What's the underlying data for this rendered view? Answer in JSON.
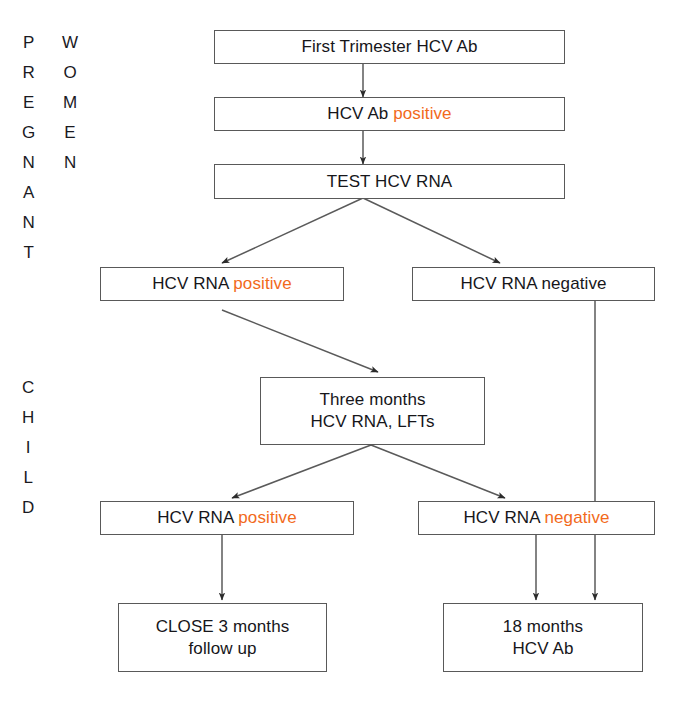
{
  "diagram": {
    "accent_color": "#f26a1b",
    "line_color": "#595959",
    "text_color": "#16161a",
    "side_labels": [
      {
        "name": "pregnant",
        "text": "PREGNANT"
      },
      {
        "name": "women",
        "text": "WOMEN"
      },
      {
        "name": "child",
        "text": "CHILD"
      }
    ],
    "nodes": [
      {
        "id": "first-trimester",
        "lines": [
          {
            "plain": "First Trimester HCV Ab",
            "highlight": ""
          }
        ]
      },
      {
        "id": "hcv-ab-positive",
        "lines": [
          {
            "plain": "HCV Ab ",
            "highlight": "positive"
          }
        ]
      },
      {
        "id": "test-hcv-rna",
        "lines": [
          {
            "plain": "TEST HCV RNA",
            "highlight": ""
          }
        ]
      },
      {
        "id": "rna-positive-mother",
        "lines": [
          {
            "plain": "HCV RNA ",
            "highlight": "positive"
          }
        ]
      },
      {
        "id": "rna-negative-mother",
        "lines": [
          {
            "plain": "HCV RNA negative",
            "highlight": ""
          }
        ]
      },
      {
        "id": "three-months",
        "lines": [
          {
            "plain": "Three months",
            "highlight": ""
          },
          {
            "plain": "HCV RNA, LFTs",
            "highlight": ""
          }
        ]
      },
      {
        "id": "rna-positive-child",
        "lines": [
          {
            "plain": "HCV RNA ",
            "highlight": "positive"
          }
        ]
      },
      {
        "id": "rna-negative-child",
        "lines": [
          {
            "plain": "HCV RNA ",
            "highlight": "negative"
          }
        ]
      },
      {
        "id": "close-followup",
        "lines": [
          {
            "plain": "CLOSE 3 months",
            "highlight": ""
          },
          {
            "plain": "follow up",
            "highlight": ""
          }
        ]
      },
      {
        "id": "eighteen-months",
        "lines": [
          {
            "plain": "18 months",
            "highlight": ""
          },
          {
            "plain": "HCV Ab",
            "highlight": ""
          }
        ]
      }
    ]
  }
}
